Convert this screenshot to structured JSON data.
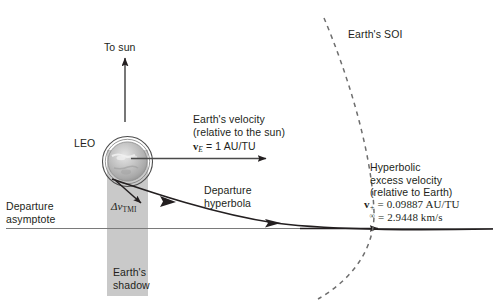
{
  "figure": {
    "background_color": "#ffffff",
    "line_color": "#231f20",
    "shadow_color": "#c9c9c9",
    "earth_color": "#b3b3b3"
  },
  "labels": {
    "to_sun": "To sun",
    "leo": "LEO",
    "earths_velocity_line1": "Earth's velocity",
    "earths_velocity_line2": "(relative to the sun)",
    "earths_velocity_value_symbol": "v",
    "earths_velocity_value_subscript": "E",
    "earths_velocity_value_rest": "= 1 AU/TU",
    "departure_hyperbola_line1": "Departure",
    "departure_hyperbola_line2": "hyperbola",
    "departure_asymptote_line1": "Departure",
    "departure_asymptote_line2": "asymptote",
    "earths_shadow_line1": "Earth's",
    "earths_shadow_line2": "shadow",
    "earths_soi": "Earth's SOI",
    "hyperbolic_excess_line1": "Hyperbolic",
    "hyperbolic_excess_line2": "excess velocity",
    "hyperbolic_excess_line3": "(relative to Earth)",
    "delta_v_symbol": "Δv",
    "delta_v_subscript": "TMI",
    "v_infinity_symbol": "v",
    "v_infinity_subscript": "∞",
    "v_infinity_superscript": "+",
    "v_infinity_value_au": "= 0.09887 AU/TU",
    "v_infinity_value_kms": "= 2.9448 km/s"
  },
  "values": {
    "earth_velocity_au_tu": 1,
    "hyperbolic_excess_velocity_au_tu": 0.09887,
    "hyperbolic_excess_velocity_km_s": 2.9448
  },
  "icons": {
    "earth_sphere": "earth-globe-icon",
    "leo_orbit": "orbit-circle-icon",
    "soi_boundary": "dashed-arc-icon",
    "arrowhead": "arrowhead-icon"
  }
}
